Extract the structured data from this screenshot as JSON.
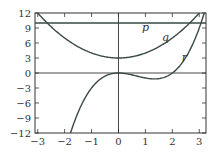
{
  "chart_data": {
    "type": "line",
    "title": "",
    "xlabel": "",
    "ylabel": "",
    "xlim": [
      -3.1,
      3.25
    ],
    "ylim": [
      -12,
      12
    ],
    "grid": false,
    "x_ticks": [
      -3,
      -2,
      -1,
      0,
      1,
      2,
      3
    ],
    "x_tick_labels": [
      "−3",
      "−2",
      "−1",
      "0",
      "1",
      "2",
      "3"
    ],
    "y_ticks": [
      -12,
      -9,
      -6,
      -3,
      0,
      3,
      6,
      9,
      12
    ],
    "y_tick_labels": [
      "−12",
      "−9",
      "−6",
      "−3",
      "0",
      "3",
      "6",
      "9",
      "12"
    ],
    "series": [
      {
        "name": "p",
        "expression": "y = 10",
        "x": [
          -3.1,
          3.25
        ],
        "values": [
          10,
          10
        ]
      },
      {
        "name": "q",
        "expression": "y = x^2 + 3",
        "x": [
          -3,
          -2,
          -1,
          0,
          1,
          2,
          3
        ],
        "values": [
          12,
          7,
          4,
          3,
          4,
          7,
          12
        ]
      },
      {
        "name": "r",
        "expression": "y = x^3 - 2x^2",
        "x": [
          -1.8,
          -1,
          0,
          1,
          1.33,
          2,
          3,
          3.15
        ],
        "values": [
          -12.3,
          -3,
          0,
          -1,
          -1.19,
          0,
          9,
          11.4
        ]
      }
    ],
    "annotations": [
      {
        "text": "p",
        "x": 1.0,
        "y": 8.5
      },
      {
        "text": "q",
        "x": 1.75,
        "y": 6.5
      },
      {
        "text": "r",
        "x": 2.45,
        "y": 2.5
      }
    ],
    "colors": {
      "curves": "#3a4a47",
      "axes": "#333333"
    }
  }
}
